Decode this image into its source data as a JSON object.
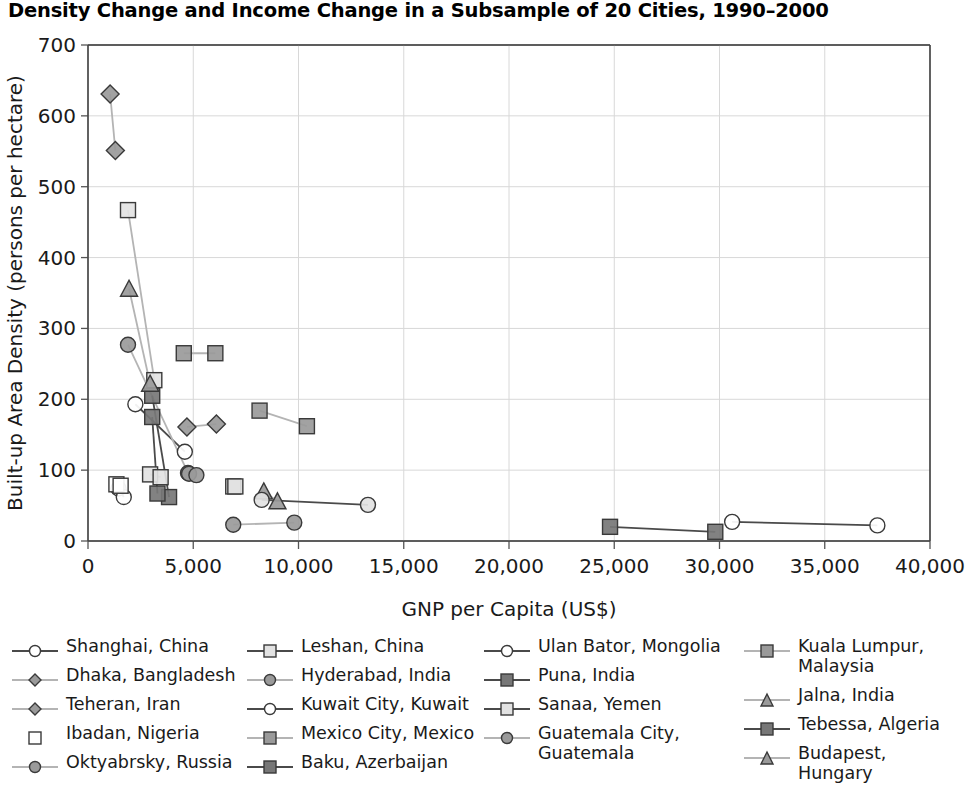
{
  "title": "Density Change and Income Change in a Subsample of 20 Cities, 1990–2000",
  "axes": {
    "x_label": "GNP per Capita (US$)",
    "y_label": "Built-up Area Density (persons per hectare)",
    "x_ticks": [
      "0",
      "5,000",
      "10,000",
      "15,000",
      "20,000",
      "25,000",
      "30,000",
      "35,000",
      "40,000"
    ],
    "y_ticks": [
      "0",
      "100",
      "200",
      "300",
      "400",
      "500",
      "600",
      "700"
    ]
  },
  "colors": {
    "marker_fill_gray": "#9a9a9a",
    "marker_fill_light": "#e2e2e2",
    "marker_fill_dark": "#777777",
    "marker_stroke": "#3a3a3a",
    "line_dark": "#4a4a4a",
    "line_light": "#b4b4b4",
    "grid": "#d8d8d8",
    "axis": "#555555",
    "text": "#1a1a1a"
  },
  "chart_data": {
    "type": "scatter",
    "title": "Density Change and Income Change in a Subsample of 20 Cities, 1990–2000",
    "xlabel": "GNP per Capita (US$)",
    "ylabel": "Built-up Area Density (persons per hectare)",
    "xlim": [
      0,
      40000
    ],
    "ylim": [
      0,
      700
    ],
    "xticks": [
      0,
      5000,
      10000,
      15000,
      20000,
      25000,
      30000,
      35000,
      40000
    ],
    "yticks": [
      0,
      100,
      200,
      300,
      400,
      500,
      600,
      700
    ],
    "grid": true,
    "legend_position": "below",
    "note": "Each city is plotted as two points (1990 and 2000) joined by a connecting line; x = GNP per capita (US$), y = built-up area density (persons per hectare).",
    "series": [
      {
        "name": "Shanghai, China",
        "marker": "circle",
        "fill": "open",
        "line": "dark",
        "points": [
          [
            2250,
            193
          ],
          [
            4600,
            126
          ]
        ]
      },
      {
        "name": "Leshan, China",
        "marker": "square",
        "fill": "light",
        "line": "light",
        "points": [
          [
            2950,
            94
          ],
          [
            3450,
            90
          ]
        ]
      },
      {
        "name": "Ulan Bator, Mongolia",
        "marker": "circle",
        "fill": "open",
        "line": "dark",
        "points": [
          [
            1450,
            74
          ],
          [
            1700,
            62
          ]
        ]
      },
      {
        "name": "Kuala Lumpur, Malaysia",
        "marker": "square",
        "fill": "gray",
        "line": "light",
        "points": [
          [
            8150,
            184
          ],
          [
            10400,
            162
          ]
        ]
      },
      {
        "name": "Dhaka, Bangladesh",
        "marker": "diamond",
        "fill": "gray",
        "line": "light",
        "points": [
          [
            1050,
            631
          ],
          [
            1300,
            551
          ]
        ]
      },
      {
        "name": "Hyderabad, India",
        "marker": "circle",
        "fill": "gray",
        "line": "light",
        "points": [
          [
            1900,
            277
          ],
          [
            4750,
            96
          ]
        ]
      },
      {
        "name": "Puna, India",
        "marker": "square",
        "fill": "dark",
        "line": "dark",
        "points": [
          [
            3050,
            205
          ],
          [
            3850,
            62
          ]
        ]
      },
      {
        "name": "Jalna, India",
        "marker": "triangle",
        "fill": "gray",
        "line": "light",
        "points": [
          [
            8350,
            70
          ],
          [
            9000,
            56
          ]
        ]
      },
      {
        "name": "Teheran, Iran",
        "marker": "diamond",
        "fill": "gray",
        "line": "light",
        "points": [
          [
            4700,
            161
          ],
          [
            6100,
            165
          ]
        ]
      },
      {
        "name": "Kuwait City, Kuwait",
        "marker": "circle",
        "fill": "open",
        "line": "dark",
        "points": [
          [
            30600,
            27
          ],
          [
            37500,
            22
          ]
        ]
      },
      {
        "name": "Sanaa, Yemen",
        "marker": "square",
        "fill": "light",
        "line": "light",
        "points": [
          [
            1900,
            467
          ],
          [
            3150,
            227
          ]
        ]
      },
      {
        "name": "Ibadan, Nigeria",
        "marker": "square",
        "fill": "open",
        "line": "none",
        "points": [
          [
            1350,
            80
          ],
          [
            1550,
            78
          ]
        ]
      },
      {
        "name": "Mexico City, Mexico",
        "marker": "square",
        "fill": "gray",
        "line": "light",
        "points": [
          [
            4550,
            265
          ],
          [
            6050,
            265
          ]
        ]
      },
      {
        "name": "Guatemala City, Guatemala",
        "marker": "circle",
        "fill": "gray",
        "line": "light",
        "points": [
          [
            6900,
            23
          ],
          [
            9800,
            26
          ]
        ]
      },
      {
        "name": "Tebessa, Algeria",
        "marker": "square",
        "fill": "dark",
        "line": "dark",
        "points": [
          [
            24800,
            20
          ],
          [
            29800,
            13
          ]
        ]
      },
      {
        "name": "Oktyabrsky, Russia",
        "marker": "circle",
        "fill": "gray",
        "line": "light",
        "points": [
          [
            4800,
            95
          ],
          [
            5150,
            93
          ]
        ]
      },
      {
        "name": "Baku, Azerbaijan",
        "marker": "square",
        "fill": "dark",
        "line": "dark",
        "points": [
          [
            3050,
            175
          ],
          [
            3300,
            67
          ]
        ]
      },
      {
        "name": "Budapest, Hungary",
        "marker": "triangle",
        "fill": "gray",
        "line": "light",
        "points": [
          [
            1950,
            356
          ],
          [
            2950,
            222
          ]
        ]
      },
      {
        "name": "City A",
        "marker": "square",
        "fill": "light",
        "line": "light",
        "points": [
          [
            6900,
            77
          ],
          [
            7000,
            77
          ]
        ]
      },
      {
        "name": "City B",
        "marker": "circle",
        "fill": "light",
        "line": "dark",
        "points": [
          [
            8250,
            58
          ],
          [
            13300,
            51
          ]
        ]
      }
    ]
  },
  "legend": {
    "columns": [
      {
        "left": 8,
        "width": 240,
        "items": [
          {
            "label": "Shanghai, China",
            "marker": "circle",
            "fill": "open",
            "line": "dark"
          },
          {
            "label": "Dhaka, Bangladesh",
            "marker": "diamond",
            "fill": "gray",
            "line": "light"
          },
          {
            "label": "Teheran, Iran",
            "marker": "diamond",
            "fill": "gray",
            "line": "light"
          },
          {
            "label": "Ibadan, Nigeria",
            "marker": "square",
            "fill": "open",
            "line": "none"
          },
          {
            "label": "Oktyabrsky, Russia",
            "marker": "circle",
            "fill": "gray",
            "line": "light"
          }
        ]
      },
      {
        "left": 243,
        "width": 240,
        "items": [
          {
            "label": "Leshan, China",
            "marker": "square",
            "fill": "light",
            "line": "dark"
          },
          {
            "label": "Hyderabad, India",
            "marker": "circle",
            "fill": "gray",
            "line": "light"
          },
          {
            "label": "Kuwait City, Kuwait",
            "marker": "circle",
            "fill": "open",
            "line": "dark"
          },
          {
            "label": "Mexico City, Mexico",
            "marker": "square",
            "fill": "gray",
            "line": "light"
          },
          {
            "label": "Baku, Azerbaijan",
            "marker": "square",
            "fill": "dark",
            "line": "dark"
          }
        ]
      },
      {
        "left": 480,
        "width": 260,
        "items": [
          {
            "label": "Ulan Bator, Mongolia",
            "marker": "circle",
            "fill": "open",
            "line": "dark"
          },
          {
            "label": "Puna, India",
            "marker": "square",
            "fill": "dark",
            "line": "dark"
          },
          {
            "label": "Sanaa, Yemen",
            "marker": "square",
            "fill": "light",
            "line": "dark"
          },
          {
            "label": "Guatemala City,\nGuatemala",
            "marker": "circle",
            "fill": "gray",
            "line": "light"
          }
        ]
      },
      {
        "left": 740,
        "width": 225,
        "items": [
          {
            "label": "Kuala Lumpur,\nMalaysia",
            "marker": "square",
            "fill": "gray",
            "line": "light"
          },
          {
            "label": "Jalna, India",
            "marker": "triangle",
            "fill": "gray",
            "line": "light"
          },
          {
            "label": "Tebessa, Algeria",
            "marker": "square",
            "fill": "dark",
            "line": "dark"
          },
          {
            "label": "Budapest, Hungary",
            "marker": "triangle",
            "fill": "gray",
            "line": "light"
          }
        ]
      }
    ]
  }
}
